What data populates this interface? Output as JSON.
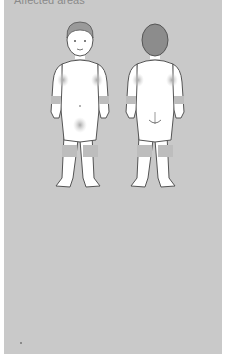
{
  "caption": "Affected areas",
  "figures": [
    {
      "view": "front",
      "label": "front-view-child"
    },
    {
      "view": "back",
      "label": "back-view-child"
    }
  ],
  "affected_areas": [
    "armpits",
    "inner elbows",
    "wrists",
    "groin",
    "knees"
  ],
  "colors": {
    "panel": "#c9c9c9",
    "body": "#ffffff",
    "outline": "#555555",
    "affected": "#b9b9b9",
    "hair_back": "#8c8c8c"
  }
}
